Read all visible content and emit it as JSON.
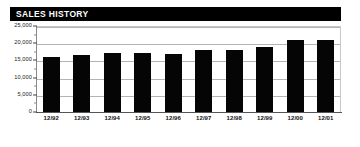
{
  "header": {
    "title": "SALES HISTORY"
  },
  "colors": {
    "banner_background": "#000000",
    "banner_text": "#ffffff",
    "bar_fill": "#050505",
    "gridline": "#b4b4b4",
    "axis": "#555555",
    "page_background": "#ffffff"
  },
  "chart_data": {
    "type": "bar",
    "title": "SALES HISTORY",
    "xlabel": "",
    "ylabel": "",
    "categories": [
      "12/92",
      "12/93",
      "12/94",
      "12/95",
      "12/96",
      "12/97",
      "12/98",
      "12/99",
      "12/00",
      "12/01"
    ],
    "values": [
      16000,
      16600,
      17100,
      17200,
      16800,
      18000,
      18000,
      19000,
      21000,
      21000
    ],
    "ylim": [
      0,
      25000
    ],
    "yticks": [
      0,
      5000,
      10000,
      15000,
      20000,
      25000
    ],
    "ytick_labels": [
      "0",
      "5,000",
      "10,000",
      "15,000",
      "20,000",
      "25,000"
    ],
    "grid": true,
    "legend": false,
    "legend_position": "none",
    "series": [
      {
        "name": "Sales",
        "values": [
          16000,
          16600,
          17100,
          17200,
          16800,
          18000,
          18000,
          19000,
          21000,
          21000
        ]
      }
    ]
  }
}
